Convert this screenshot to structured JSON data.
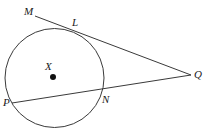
{
  "figure": {
    "kind": "geometry-diagram",
    "background_color": "#ffffff",
    "stroke_color": "#3a3a3a",
    "label_color": "#1a1a1a",
    "width": 209,
    "height": 131
  },
  "circle": {
    "name": "circle-x",
    "center_x": 54.5,
    "center_y": 78,
    "radius": 49.5,
    "stroke_width": 1
  },
  "center_point": {
    "label": "X",
    "dot_x": 53,
    "dot_y": 77,
    "dot_radius": 3,
    "label_x": 45,
    "label_y": 61
  },
  "lines": [
    {
      "name": "tangent-line-mq",
      "from": "M",
      "through": "L",
      "to": "Q",
      "x1": 35,
      "y1": 16,
      "x2": 191,
      "y2": 75
    },
    {
      "name": "secant-line-pq",
      "from": "P",
      "through": "N",
      "to": "Q",
      "x1": 12,
      "y1": 103,
      "x2": 191,
      "y2": 75
    }
  ],
  "labels": [
    {
      "name": "point-label-m",
      "text": "M",
      "x": 24,
      "y": 6
    },
    {
      "name": "point-label-l",
      "text": "L",
      "x": 72,
      "y": 17
    },
    {
      "name": "point-label-q",
      "text": "Q",
      "x": 194,
      "y": 69
    },
    {
      "name": "point-label-n",
      "text": "N",
      "x": 102,
      "y": 94
    },
    {
      "name": "point-label-p",
      "text": "P",
      "x": 3,
      "y": 97
    }
  ]
}
